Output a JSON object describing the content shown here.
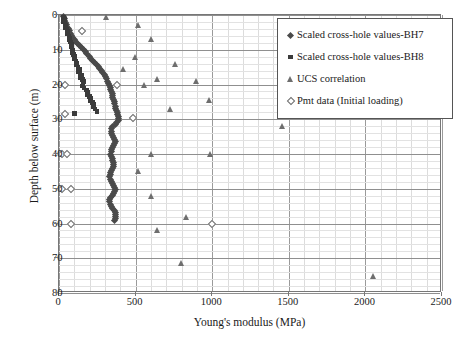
{
  "chart_data": {
    "type": "scatter",
    "title": "",
    "xlabel": "Young's modulus (MPa)",
    "ylabel": "Depth below surface (m)",
    "xlim": [
      0,
      2500
    ],
    "ylim": [
      0,
      80
    ],
    "y_inverted": true,
    "xticks": [
      0,
      500,
      1000,
      1500,
      2000,
      2500
    ],
    "yticks": [
      0,
      10,
      20,
      30,
      40,
      50,
      60,
      70,
      80
    ],
    "x_minor_step": 100,
    "y_minor_step": 2,
    "grid": true,
    "legend_position": "upper right",
    "series": [
      {
        "name": "Scaled cross-hole values-BH7",
        "marker": "filled-diamond",
        "color": "#4a4a4a",
        "points": [
          [
            30,
            0.4
          ],
          [
            38,
            1.0
          ],
          [
            34,
            1.6
          ],
          [
            45,
            2.2
          ],
          [
            52,
            2.8
          ],
          [
            48,
            3.4
          ],
          [
            60,
            4.0
          ],
          [
            68,
            4.6
          ],
          [
            75,
            5.2
          ],
          [
            82,
            5.8
          ],
          [
            90,
            6.4
          ],
          [
            98,
            7.0
          ],
          [
            110,
            7.6
          ],
          [
            120,
            8.2
          ],
          [
            132,
            8.8
          ],
          [
            145,
            9.4
          ],
          [
            158,
            10.0
          ],
          [
            170,
            10.6
          ],
          [
            182,
            11.2
          ],
          [
            196,
            11.8
          ],
          [
            208,
            12.4
          ],
          [
            220,
            13.0
          ],
          [
            232,
            13.6
          ],
          [
            244,
            14.2
          ],
          [
            256,
            14.8
          ],
          [
            266,
            15.4
          ],
          [
            276,
            16.0
          ],
          [
            286,
            16.6
          ],
          [
            296,
            17.2
          ],
          [
            304,
            17.8
          ],
          [
            312,
            18.4
          ],
          [
            318,
            19.0
          ],
          [
            324,
            19.6
          ],
          [
            330,
            20.2
          ],
          [
            334,
            20.8
          ],
          [
            338,
            21.4
          ],
          [
            342,
            22.0
          ],
          [
            346,
            22.6
          ],
          [
            350,
            23.2
          ],
          [
            352,
            23.8
          ],
          [
            356,
            24.4
          ],
          [
            360,
            25.0
          ],
          [
            364,
            25.6
          ],
          [
            368,
            26.2
          ],
          [
            372,
            26.8
          ],
          [
            376,
            27.4
          ],
          [
            380,
            28.0
          ],
          [
            384,
            28.6
          ],
          [
            386,
            29.2
          ],
          [
            388,
            29.8
          ],
          [
            386,
            30.4
          ],
          [
            378,
            31.0
          ],
          [
            366,
            31.6
          ],
          [
            352,
            32.2
          ],
          [
            344,
            32.8
          ],
          [
            340,
            33.4
          ],
          [
            342,
            34.0
          ],
          [
            348,
            34.6
          ],
          [
            356,
            35.2
          ],
          [
            362,
            35.8
          ],
          [
            366,
            36.4
          ],
          [
            364,
            37.0
          ],
          [
            358,
            37.6
          ],
          [
            350,
            38.2
          ],
          [
            344,
            38.8
          ],
          [
            340,
            39.4
          ],
          [
            338,
            40.0
          ],
          [
            340,
            40.6
          ],
          [
            346,
            41.2
          ],
          [
            352,
            41.8
          ],
          [
            356,
            42.4
          ],
          [
            358,
            43.0
          ],
          [
            356,
            43.6
          ],
          [
            350,
            44.2
          ],
          [
            344,
            44.8
          ],
          [
            338,
            45.4
          ],
          [
            334,
            46.0
          ],
          [
            332,
            46.6
          ],
          [
            334,
            47.2
          ],
          [
            340,
            47.8
          ],
          [
            348,
            48.4
          ],
          [
            356,
            49.0
          ],
          [
            362,
            49.6
          ],
          [
            366,
            50.2
          ],
          [
            364,
            50.8
          ],
          [
            356,
            51.4
          ],
          [
            346,
            52.0
          ],
          [
            338,
            52.6
          ],
          [
            332,
            53.2
          ],
          [
            330,
            53.8
          ],
          [
            334,
            54.4
          ],
          [
            342,
            55.0
          ],
          [
            352,
            55.6
          ],
          [
            360,
            56.2
          ],
          [
            366,
            56.8
          ],
          [
            370,
            57.4
          ],
          [
            372,
            58.0
          ],
          [
            368,
            58.6
          ],
          [
            360,
            59.2
          ]
        ]
      },
      {
        "name": "Scaled cross-hole values-BH8",
        "marker": "filled-square",
        "color": "#3b3b3b",
        "points": [
          [
            28,
            0.6
          ],
          [
            34,
            1.2
          ],
          [
            30,
            1.8
          ],
          [
            40,
            2.4
          ],
          [
            46,
            3.0
          ],
          [
            42,
            3.6
          ],
          [
            52,
            4.2
          ],
          [
            58,
            4.8
          ],
          [
            56,
            5.4
          ],
          [
            64,
            6.0
          ],
          [
            70,
            6.6
          ],
          [
            66,
            7.2
          ],
          [
            74,
            7.8
          ],
          [
            80,
            8.4
          ],
          [
            78,
            9.0
          ],
          [
            86,
            9.6
          ],
          [
            92,
            10.2
          ],
          [
            88,
            10.8
          ],
          [
            96,
            11.4
          ],
          [
            104,
            12.0
          ],
          [
            100,
            12.6
          ],
          [
            110,
            13.2
          ],
          [
            118,
            13.8
          ],
          [
            114,
            14.4
          ],
          [
            124,
            15.0
          ],
          [
            132,
            15.6
          ],
          [
            128,
            16.2
          ],
          [
            138,
            16.8
          ],
          [
            146,
            17.4
          ],
          [
            142,
            18.0
          ],
          [
            152,
            18.6
          ],
          [
            160,
            19.2
          ],
          [
            156,
            19.8
          ],
          [
            150,
            20.4
          ],
          [
            164,
            21.0
          ],
          [
            178,
            21.6
          ],
          [
            190,
            22.2
          ],
          [
            186,
            22.8
          ],
          [
            198,
            23.4
          ],
          [
            210,
            24.0
          ],
          [
            206,
            24.6
          ],
          [
            218,
            25.2
          ],
          [
            228,
            25.8
          ],
          [
            222,
            26.4
          ],
          [
            234,
            27.0
          ],
          [
            100,
            28.4
          ],
          [
            248,
            27.8
          ]
        ]
      },
      {
        "name": "UCS correlation",
        "marker": "open-triangle",
        "color": "#6e6e6e",
        "points": [
          [
            310,
            0.5
          ],
          [
            520,
            3.0
          ],
          [
            600,
            7.0
          ],
          [
            500,
            12.0
          ],
          [
            420,
            15.5
          ],
          [
            760,
            14.0
          ],
          [
            640,
            18.5
          ],
          [
            560,
            20.0
          ],
          [
            900,
            19.0
          ],
          [
            980,
            24.5
          ],
          [
            730,
            27.0
          ],
          [
            1460,
            32.0
          ],
          [
            600,
            40.0
          ],
          [
            990,
            40.0
          ],
          [
            520,
            45.0
          ],
          [
            600,
            52.0
          ],
          [
            830,
            58.0
          ],
          [
            640,
            62.0
          ],
          [
            800,
            71.5
          ],
          [
            2050,
            75.0
          ]
        ]
      },
      {
        "name": "Pmt data (Initial loading)",
        "marker": "open-diamond",
        "color": "#6b6b6b",
        "points": [
          [
            150,
            4.5
          ],
          [
            40,
            20.0
          ],
          [
            380,
            20.0
          ],
          [
            40,
            28.5
          ],
          [
            480,
            29.5
          ],
          [
            20,
            40.0
          ],
          [
            55,
            40.0
          ],
          [
            20,
            50.0
          ],
          [
            80,
            50.0
          ],
          [
            80,
            60.0
          ],
          [
            1000,
            60.0
          ]
        ]
      }
    ]
  },
  "axes": {
    "xlabel": "Young's modulus (MPa)",
    "ylabel": "Depth below surface (m)",
    "xticks": [
      "0",
      "500",
      "1000",
      "1500",
      "2000",
      "2500"
    ],
    "yticks": [
      "0",
      "10",
      "20",
      "30",
      "40",
      "50",
      "60",
      "70",
      "80"
    ]
  },
  "legend": {
    "items": [
      {
        "label": "Scaled cross-hole values-BH7",
        "marker": "filled-diamond"
      },
      {
        "label": "Scaled cross-hole values-BH8",
        "marker": "filled-square"
      },
      {
        "label": "UCS correlation",
        "marker": "open-triangle"
      },
      {
        "label": "Pmt data (Initial loading)",
        "marker": "open-diamond"
      }
    ]
  }
}
